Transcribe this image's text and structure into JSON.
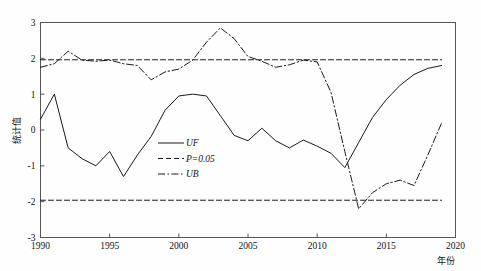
{
  "chart_data": {
    "type": "line",
    "title": "",
    "xlabel": "年份",
    "ylabel": "统计值",
    "xlim": [
      1990,
      2020
    ],
    "ylim": [
      -3,
      3
    ],
    "xticks": [
      1990,
      1995,
      2000,
      2005,
      2010,
      2015,
      2020
    ],
    "xtick_labels": [
      "1990",
      "1995",
      "2000",
      "2005",
      "2010",
      "2015",
      "2020"
    ],
    "yticks": [
      -3,
      -2,
      -1,
      0,
      1,
      2,
      3
    ],
    "ytick_labels": [
      "-3",
      "-2",
      "-1",
      "0",
      "1",
      "2",
      "3"
    ],
    "grid": false,
    "legend_position": "center-left-inside",
    "x": [
      1990,
      1991,
      1992,
      1993,
      1994,
      1995,
      1996,
      1997,
      1998,
      1999,
      2000,
      2001,
      2002,
      2003,
      2004,
      2005,
      2006,
      2007,
      2008,
      2009,
      2010,
      2011,
      2012,
      2013,
      2014,
      2015,
      2016,
      2017,
      2018,
      2019
    ],
    "series": [
      {
        "name": "UF",
        "style": "solid",
        "values": [
          0.3,
          1.0,
          -0.5,
          -0.8,
          -1.0,
          -0.6,
          -1.3,
          -0.7,
          -0.18,
          0.55,
          0.95,
          1.0,
          0.95,
          0.4,
          -0.15,
          -0.3,
          0.05,
          -0.3,
          -0.5,
          -0.28,
          -0.45,
          -0.65,
          -1.05,
          -0.35,
          0.35,
          0.85,
          1.25,
          1.55,
          1.72,
          1.8
        ]
      },
      {
        "name": "P=0.05",
        "style": "dashed",
        "values": [
          1.96,
          1.96,
          1.96,
          1.96,
          1.96,
          1.96,
          1.96,
          1.96,
          1.96,
          1.96,
          1.96,
          1.96,
          1.96,
          1.96,
          1.96,
          1.96,
          1.96,
          1.96,
          1.96,
          1.96,
          1.96,
          1.96,
          1.96,
          1.96,
          1.96,
          1.96,
          1.96,
          1.96,
          1.96,
          1.96
        ],
        "values_lower": [
          -1.96,
          -1.96,
          -1.96,
          -1.96,
          -1.96,
          -1.96,
          -1.96,
          -1.96,
          -1.96,
          -1.96,
          -1.96,
          -1.96,
          -1.96,
          -1.96,
          -1.96,
          -1.96,
          -1.96,
          -1.96,
          -1.96,
          -1.96,
          -1.96,
          -1.96,
          -1.96,
          -1.96,
          -1.96,
          -1.96,
          -1.96,
          -1.96,
          -1.96,
          -1.96
        ]
      },
      {
        "name": "UB",
        "style": "dash-dot",
        "values": [
          1.75,
          1.85,
          2.2,
          1.95,
          1.92,
          1.95,
          1.85,
          1.8,
          1.4,
          1.62,
          1.7,
          1.95,
          2.45,
          2.85,
          2.55,
          2.05,
          1.92,
          1.75,
          1.82,
          1.95,
          1.9,
          1.05,
          -0.6,
          -2.2,
          -1.75,
          -1.5,
          -1.4,
          -1.55,
          -0.7,
          0.2
        ]
      }
    ],
    "legend": [
      {
        "label": "UF",
        "style": "solid"
      },
      {
        "label": "P=0.05",
        "style": "dashed"
      },
      {
        "label": "UB",
        "style": "dash-dot"
      }
    ],
    "colors": {
      "line": "#1a1a1a",
      "axis": "#555555",
      "background": "#fefefe"
    }
  }
}
